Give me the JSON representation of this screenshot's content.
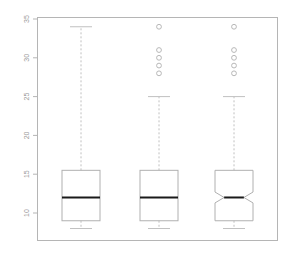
{
  "figure": {
    "title": "",
    "background_color": "#ffffff",
    "frame_color": "#b5b5b5",
    "box_color": "#b0b0b0",
    "median_color": "#1a1a1a",
    "whisker_color": "#c0c0c0",
    "outlier_color": "#b8b8b8",
    "tick_label_color": "#9a9a9a"
  },
  "chart_data": {
    "type": "box",
    "title": "",
    "xlabel": "",
    "ylabel": "",
    "ylim": [
      8,
      35
    ],
    "grid": false,
    "legend": null,
    "yticks": [
      10,
      15,
      20,
      25,
      30,
      35
    ],
    "ytick_labels": [
      "10",
      "15",
      "20",
      "25",
      "30",
      "35"
    ],
    "ytick_label_rotation": 90,
    "xticks": [],
    "xtick_labels": [
      "",
      "",
      ""
    ],
    "categories": [
      "1",
      "2",
      "3"
    ],
    "boxes": [
      {
        "name": "1",
        "notched": false,
        "whisker_low": 8,
        "q1": 9,
        "median": 12,
        "q3": 15.5,
        "whisker_high": 34,
        "notch_low": null,
        "notch_high": null,
        "outliers": []
      },
      {
        "name": "2",
        "notched": false,
        "whisker_low": 8,
        "q1": 9,
        "median": 12,
        "q3": 15.5,
        "whisker_high": 25,
        "notch_low": null,
        "notch_high": null,
        "outliers": [
          34,
          31,
          30,
          29,
          28
        ]
      },
      {
        "name": "3",
        "notched": true,
        "whisker_low": 8,
        "q1": 9,
        "median": 12,
        "q3": 15.5,
        "whisker_high": 25,
        "notch_low": 11.3,
        "notch_high": 12.7,
        "outliers": [
          34,
          31,
          30,
          29,
          28
        ]
      }
    ]
  }
}
